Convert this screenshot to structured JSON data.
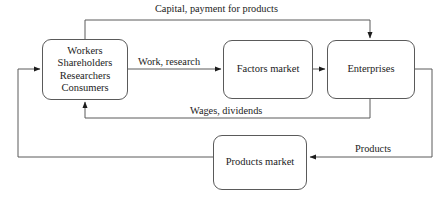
{
  "diagram": {
    "type": "flow-diagram",
    "colors": {
      "stroke": "#5a5a5a",
      "arrow": "#1c1c1c",
      "text": "#1c1c1c",
      "background": "#ffffff"
    },
    "nodes": [
      {
        "id": "households",
        "lines": [
          "Workers",
          "Shareholders",
          "Researchers",
          "Consumers"
        ]
      },
      {
        "id": "factors-market",
        "lines": [
          "Factors market"
        ]
      },
      {
        "id": "enterprises",
        "lines": [
          "Enterprises"
        ]
      },
      {
        "id": "products-market",
        "lines": [
          "Products market"
        ]
      }
    ],
    "edges": [
      {
        "id": "capital",
        "label": "Capital, payment for products",
        "from": "households",
        "to": "enterprises"
      },
      {
        "id": "work",
        "label": "Work, research",
        "from": "households",
        "to": "factors-market"
      },
      {
        "id": "factors-to-enterprises",
        "label": "",
        "from": "factors-market",
        "to": "enterprises"
      },
      {
        "id": "wages",
        "label": "Wages, dividends",
        "from": "enterprises",
        "to": "households"
      },
      {
        "id": "products",
        "label": "Products",
        "from": "enterprises",
        "to": "products-market"
      },
      {
        "id": "products-to-households",
        "label": "",
        "from": "products-market",
        "to": "households"
      }
    ]
  }
}
